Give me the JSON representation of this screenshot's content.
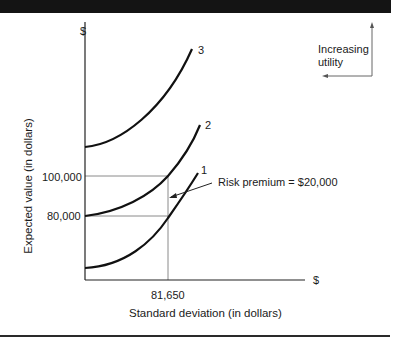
{
  "diagram": {
    "type": "indifference-curves",
    "axes": {
      "y_symbol": "$",
      "x_symbol": "$",
      "ylabel": "Expected value (in dollars)",
      "xlabel": "Standard deviation (in dollars)"
    },
    "y_ticks": [
      {
        "label": "100,000",
        "value": 100000
      },
      {
        "label": "80,000",
        "value": 80000
      }
    ],
    "x_ticks": [
      {
        "label": "81,650",
        "value": 81650
      }
    ],
    "curves": [
      {
        "id": "1",
        "label": "1"
      },
      {
        "id": "2",
        "label": "2"
      },
      {
        "id": "3",
        "label": "3"
      }
    ],
    "annotation": {
      "text": "Risk premium = $20,000"
    },
    "utility_indicator": {
      "line1": "Increasing",
      "line2": "utility"
    },
    "colors": {
      "curve": "#111111",
      "axis": "#222222",
      "guide": "#8a8a8a",
      "bar": "#141414"
    }
  }
}
